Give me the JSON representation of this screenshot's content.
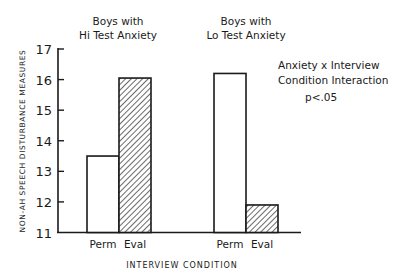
{
  "chart_data": {
    "type": "bar",
    "title": "",
    "groups": [
      {
        "label_line1": "Boys with",
        "label_line2": "Hi Test Anxiety",
        "name": "Boys with Hi Test Anxiety"
      },
      {
        "label_line1": "Boys with",
        "label_line2": "Lo Test Anxiety",
        "name": "Boys with Lo Test Anxiety"
      }
    ],
    "categories": [
      "Perm",
      "Eval"
    ],
    "series": [
      {
        "name": "Boys with Hi Test Anxiety",
        "values": [
          13.5,
          16.05
        ]
      },
      {
        "name": "Boys with Lo Test Anxiety",
        "values": [
          16.2,
          11.9
        ]
      }
    ],
    "bar_styles": {
      "Perm": "white-fill",
      "Eval": "diagonal-hatch"
    },
    "xlabel": "INTERVIEW CONDITION",
    "ylabel": "NON-AH SPEECH DISTURBANCE MEASURES",
    "ylim": [
      11,
      17
    ],
    "yticks": [
      "11",
      "12",
      "13",
      "14",
      "15",
      "16",
      "17"
    ],
    "annotation": {
      "line1": "Anxiety x Interview",
      "line2": "Condition Interaction",
      "line3": "p<.05"
    },
    "grid": false,
    "legend": "none"
  },
  "colors": {
    "ink": "#1a1a1a",
    "background": "#ffffff"
  }
}
